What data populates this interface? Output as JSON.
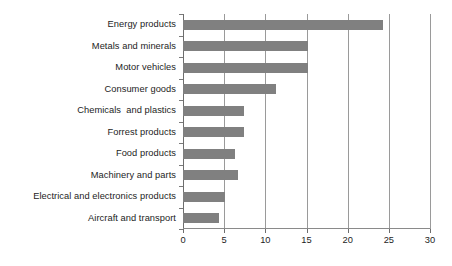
{
  "chart_data": {
    "type": "bar",
    "orientation": "horizontal",
    "title": "",
    "subtitle": "",
    "xlabel": "",
    "ylabel": "",
    "xlim": [
      0,
      30
    ],
    "grid": "vertical",
    "legend": "none",
    "x_ticks": [
      0,
      5,
      10,
      15,
      20,
      25,
      30
    ],
    "x_tick_labels": [
      "0",
      "5",
      "10",
      "15",
      "20",
      "25",
      "30"
    ],
    "categories": [
      "Energy products",
      "Metals and minerals",
      "Motor vehicles",
      "Consumer goods",
      "Chemicals  and plastics",
      "Forrest products",
      "Food products",
      "Machinery and parts",
      "Electrical and electronics products",
      "Aircraft and transport"
    ],
    "values": [
      24.3,
      15.2,
      15.2,
      11.3,
      7.4,
      7.4,
      6.3,
      6.7,
      5.1,
      4.4
    ],
    "bar_color": "#808080",
    "gridline_color": "#9a9a9a",
    "axis_color": "#6e6e6e",
    "background_color": "#ffffff"
  }
}
